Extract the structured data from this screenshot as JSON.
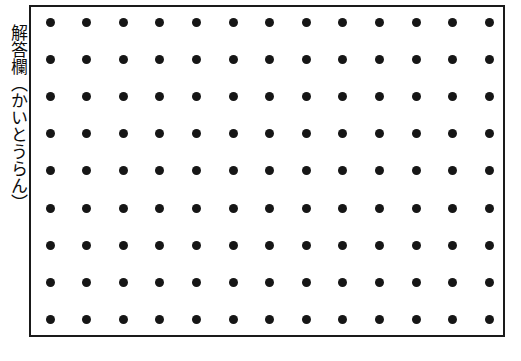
{
  "page": {
    "background_color": "#ffffff",
    "width": 521,
    "height": 361
  },
  "caption": {
    "text": "解答欄（かいとうらん）",
    "orientation": "vertical",
    "color": "#0d0d0d"
  },
  "answer_box": {
    "label": "answer-field",
    "border_color": "#1a1a1a",
    "border_width_px": 2,
    "fill_color": "#ffffff",
    "left": 29,
    "top": 5,
    "width": 476,
    "height": 332
  },
  "dot_grid": {
    "rows": 9,
    "columns": 13,
    "dot_color": "#161616",
    "dot_diameter_px": 9,
    "column_spacing_px": 36.6,
    "row_spacing_px": 37.2,
    "first_dot_x_px": 19,
    "first_dot_y_px": 15,
    "total_dots": 117
  }
}
